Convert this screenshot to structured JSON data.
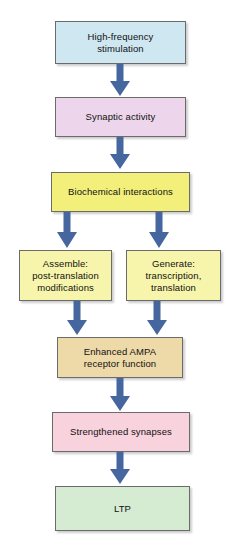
{
  "diagram": {
    "background_color": "#ffffff",
    "arrow_color": "#45669f",
    "border_color": "#6b6b6b",
    "text_color": "#111111",
    "nodes": [
      {
        "id": "high-frequency-stimulation",
        "label": "High-frequency\nstimulation",
        "fill": "#cee7f0"
      },
      {
        "id": "synaptic-activity",
        "label": "Synaptic activity",
        "fill": "#edd6ec"
      },
      {
        "id": "biochemical-interactions",
        "label": "Biochemical interactions",
        "fill": "#f2f07a"
      },
      {
        "id": "assemble-post-translation-modifications",
        "label": "Assemble:\npost-translation\nmodifications",
        "fill": "#f7f5ab"
      },
      {
        "id": "generate-transcription-translation",
        "label": "Generate:\ntranscription,\ntranslation",
        "fill": "#f7f5ab"
      },
      {
        "id": "enhanced-ampa-receptor-function",
        "label": "Enhanced AMPA\nreceptor function",
        "fill": "#eed9a8"
      },
      {
        "id": "strengthened-synapses",
        "label": "Strengthened synapses",
        "fill": "#f8d2dd"
      },
      {
        "id": "ltp",
        "label": "LTP",
        "fill": "#d5ebd2"
      }
    ],
    "edges": [
      {
        "id": "edge-stimulation-to-synaptic",
        "from": "high-frequency-stimulation",
        "to": "synaptic-activity"
      },
      {
        "id": "edge-synaptic-to-biochemical",
        "from": "synaptic-activity",
        "to": "biochemical-interactions"
      },
      {
        "id": "edge-biochemical-to-assemble",
        "from": "biochemical-interactions",
        "to": "assemble-post-translation-modifications"
      },
      {
        "id": "edge-biochemical-to-generate",
        "from": "biochemical-interactions",
        "to": "generate-transcription-translation"
      },
      {
        "id": "edge-assemble-to-ampa",
        "from": "assemble-post-translation-modifications",
        "to": "enhanced-ampa-receptor-function"
      },
      {
        "id": "edge-generate-to-ampa",
        "from": "generate-transcription-translation",
        "to": "enhanced-ampa-receptor-function"
      },
      {
        "id": "edge-ampa-to-strengthened",
        "from": "enhanced-ampa-receptor-function",
        "to": "strengthened-synapses"
      },
      {
        "id": "edge-strengthened-to-ltp",
        "from": "strengthened-synapses",
        "to": "ltp"
      }
    ]
  }
}
